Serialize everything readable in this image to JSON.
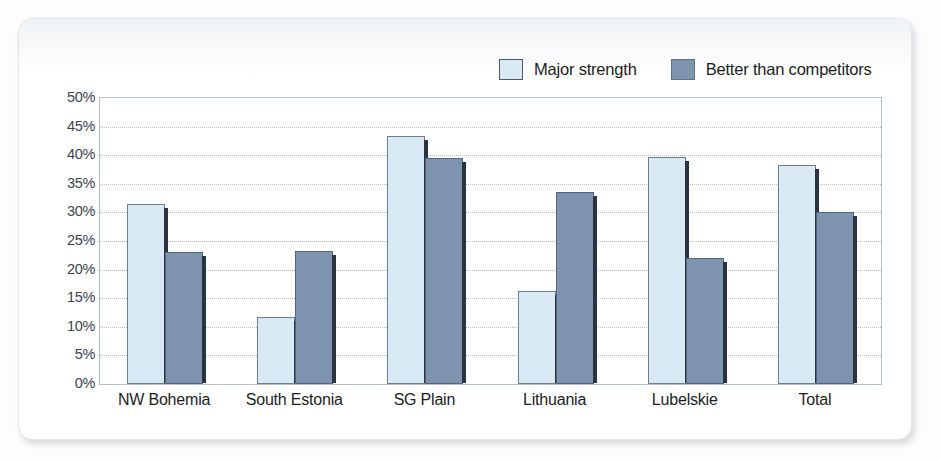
{
  "chart_data": {
    "type": "bar",
    "title": "",
    "xlabel": "",
    "ylabel": "",
    "ylim": [
      0,
      50
    ],
    "grid": true,
    "legend_position": "top-right",
    "categories": [
      "NW Bohemia",
      "South Estonia",
      "SG Plain",
      "Lithuania",
      "Lubelskie",
      "Total"
    ],
    "ytick_labels": [
      "0%",
      "5%",
      "10%",
      "15%",
      "20%",
      "25%",
      "30%",
      "35%",
      "40%",
      "45%",
      "50%"
    ],
    "ytick_values": [
      0,
      5,
      10,
      15,
      20,
      25,
      30,
      35,
      40,
      45,
      50
    ],
    "series": [
      {
        "name": "Major strength",
        "color": "#daeaf4",
        "values": [
          31.5,
          11.7,
          43.3,
          16.3,
          39.7,
          38.3
        ]
      },
      {
        "name": "Better than competitors",
        "color": "#7d93ae",
        "values": [
          23.0,
          23.3,
          39.5,
          33.5,
          22.0,
          30.0
        ]
      }
    ]
  },
  "legend": {
    "items": [
      {
        "label": "Major strength",
        "swatch": "light-blue-swatch"
      },
      {
        "label": "Better than competitors",
        "swatch": "dark-blue-swatch"
      }
    ]
  },
  "colors": {
    "series_light": "#daeaf4",
    "series_dark": "#7d93ae",
    "axis": "#b9bfc6",
    "gridline": "#b6bec8",
    "text": "#1d1d1d"
  }
}
